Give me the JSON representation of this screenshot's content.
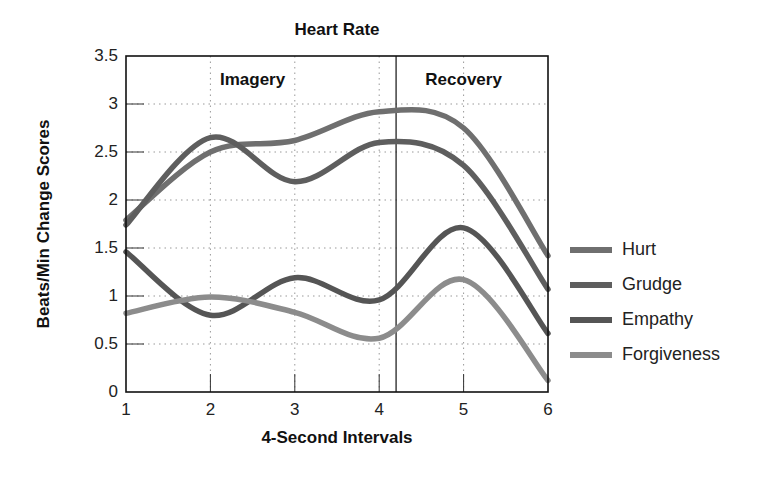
{
  "chart_data": {
    "type": "line",
    "title": "Heart Rate",
    "xlabel": "4-Second Intervals",
    "ylabel": "Beats/Min Change Scores",
    "x": [
      1,
      2,
      3,
      4,
      5,
      6
    ],
    "xlim": [
      1,
      6
    ],
    "ylim": [
      0,
      3.5
    ],
    "xticks": [
      "1",
      "2",
      "3",
      "4",
      "5",
      "6"
    ],
    "yticks": [
      "0",
      "0.5",
      "1",
      "1.5",
      "2",
      "2.5",
      "3",
      "3.5"
    ],
    "grid": "dotted",
    "legend_position": "right",
    "annotations": [
      {
        "text": "Imagery",
        "x": 2.5
      },
      {
        "text": "Recovery",
        "x": 5.0
      }
    ],
    "phase_divider_x": 4.2,
    "series": [
      {
        "name": "Hurt",
        "color": "#6f6f6f",
        "values": [
          1.79,
          2.5,
          2.62,
          2.92,
          2.75,
          1.42
        ]
      },
      {
        "name": "Grudge",
        "color": "#5e5e5e",
        "values": [
          1.74,
          2.65,
          2.19,
          2.6,
          2.36,
          1.07
        ]
      },
      {
        "name": "Empathy",
        "color": "#555555",
        "values": [
          1.46,
          0.8,
          1.19,
          0.96,
          1.71,
          0.61
        ]
      },
      {
        "name": "Forgiveness",
        "color": "#8c8c8c",
        "values": [
          0.82,
          0.99,
          0.83,
          0.56,
          1.17,
          0.12
        ]
      }
    ]
  }
}
